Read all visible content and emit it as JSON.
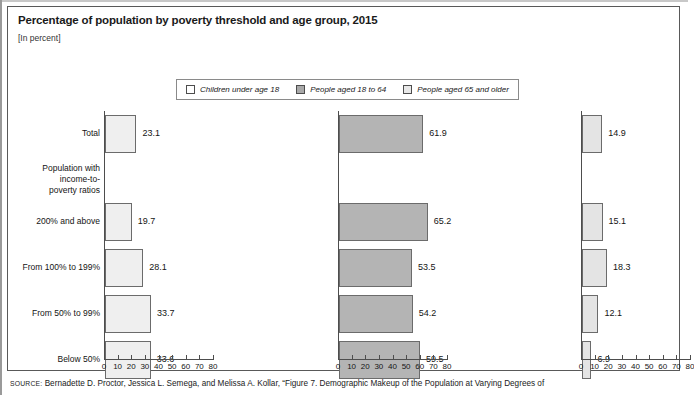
{
  "figure": {
    "title": "Percentage of population by poverty threshold and age group, 2015",
    "subtitle": "[In percent]",
    "source_prefix": "SOURCE:",
    "source_text": " Bernadette D. Proctor, Jessica L. Semega, and Melissa A. Kollar, “Figure 7. Demographic Makeup of the Population at Varying Degrees of"
  },
  "legend": {
    "items": [
      {
        "label": "Children under age 18",
        "swatch": "legend-swatch-white",
        "color": "#ffffff"
      },
      {
        "label": "People aged 18 to 64",
        "swatch": "legend-swatch-gray",
        "color": "#a9a9a9"
      },
      {
        "label": "People aged 65 and older",
        "swatch": "legend-swatch-light",
        "color": "#e8e8e8"
      }
    ]
  },
  "axis": {
    "ticks": [
      "0",
      "10",
      "20",
      "30",
      "40",
      "50",
      "60",
      "70",
      "80"
    ]
  },
  "categories": [
    {
      "label": "Total",
      "lines": [
        "Total"
      ]
    },
    {
      "label": "Population with income-to-poverty ratios",
      "lines": [
        "Population with",
        "income-to-",
        "poverty ratios"
      ]
    },
    {
      "label": "200% and above",
      "lines": [
        "200% and above"
      ]
    },
    {
      "label": "From 100% to 199%",
      "lines": [
        "From 100% to 199%"
      ]
    },
    {
      "label": "From 50% to 99%",
      "lines": [
        "From 50% to 99%"
      ]
    },
    {
      "label": "Below 50%",
      "lines": [
        "Below 50%"
      ]
    }
  ],
  "chart_data": {
    "type": "bar",
    "title": "Percentage of population by poverty threshold and age group, 2015",
    "subtitle": "[In percent]",
    "xlabel": "",
    "ylabel": "",
    "xlim": [
      0,
      80
    ],
    "grid": false,
    "orientation": "horizontal",
    "legend_position": "top-center",
    "xticks": [
      0,
      10,
      20,
      30,
      40,
      50,
      60,
      70,
      80
    ],
    "categories": [
      "Total",
      "200% and above",
      "From 100% to 199%",
      "From 50% to 99%",
      "Below 50%"
    ],
    "series": [
      {
        "name": "Children under age 18",
        "panel": "left",
        "color": "#efefef",
        "values": [
          23.1,
          19.7,
          28.1,
          33.7,
          33.6
        ],
        "labels": [
          "23.1",
          "19.7",
          "28.1",
          "33.7",
          "33.6"
        ]
      },
      {
        "name": "People aged 18 to 64",
        "panel": "middle",
        "color": "#b4b4b4",
        "values": [
          61.9,
          65.2,
          53.5,
          54.2,
          59.5
        ],
        "labels": [
          "61.9",
          "65.2",
          "53.5",
          "54.2",
          "59.5"
        ]
      },
      {
        "name": "People aged 65 and older",
        "panel": "right",
        "color": "#e4e4e4",
        "values": [
          14.9,
          15.1,
          18.3,
          12.1,
          6.9
        ],
        "labels": [
          "14.9",
          "15.1",
          "18.3",
          "12.1",
          "6.9"
        ]
      }
    ]
  }
}
